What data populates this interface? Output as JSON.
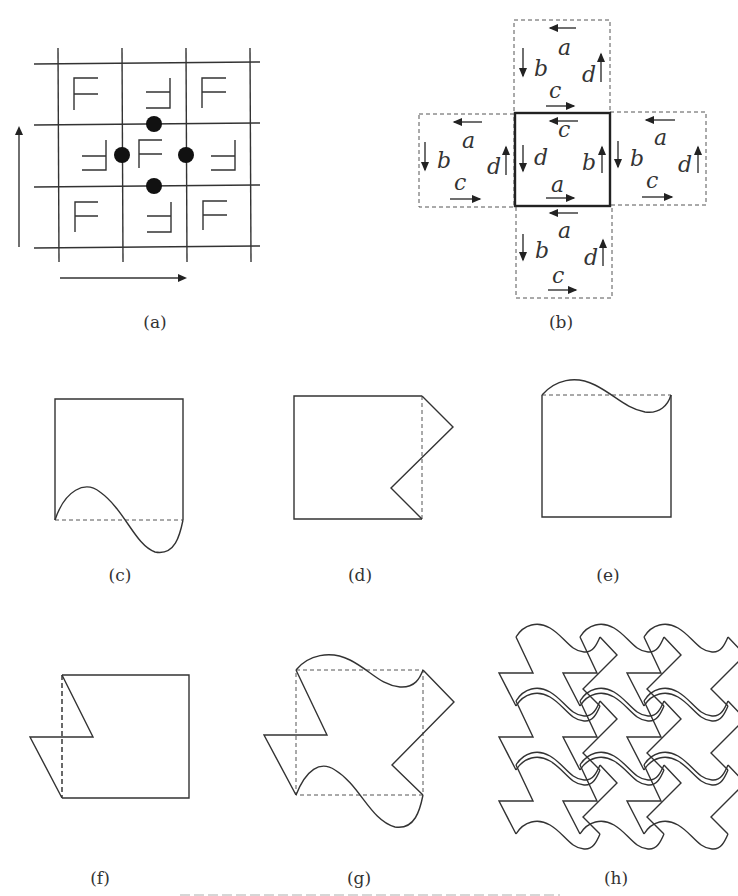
{
  "figure": {
    "panels": [
      {
        "id": "a",
        "label": "(a)",
        "description": "3x3 grid of F glyphs in alternating orientations with four glide/rotation centers (dots) and translation arrows"
      },
      {
        "id": "b",
        "label": "(b)",
        "description": "Central square with edge labels and four dashed neighbouring squares showing edge correspondences"
      },
      {
        "id": "c",
        "label": "(c)",
        "description": "Square with bottom edge replaced by S-curve"
      },
      {
        "id": "d",
        "label": "(d)",
        "description": "Square with right edge replaced by zig-zag"
      },
      {
        "id": "e",
        "label": "(e)",
        "description": "Square with top edge replaced by S-curve"
      },
      {
        "id": "f",
        "label": "(f)",
        "description": "Square with left edge replaced by zig-zag"
      },
      {
        "id": "g",
        "label": "(g)",
        "description": "Combined tile with all modified edges"
      },
      {
        "id": "h",
        "label": "(h)",
        "description": "Tiling of the plane by the combined tile"
      }
    ],
    "panel_a": {
      "glyph": "F",
      "dot_count": 4,
      "arrows": [
        "up-arrow",
        "right-arrow"
      ]
    },
    "panel_b": {
      "center": {
        "top": "c",
        "left": "d",
        "right": "b",
        "bottom": "a"
      },
      "neighbors": {
        "top": {
          "top": "a",
          "left": "b",
          "right": "d",
          "bottom": "c"
        },
        "left": {
          "top": "a",
          "left": "b",
          "right": "d",
          "bottom": "c"
        },
        "right": {
          "top": "a",
          "left": "b",
          "right": "d",
          "bottom": "c"
        },
        "bottom": {
          "top": "a",
          "left": "b",
          "right": "d",
          "bottom": "c"
        }
      }
    },
    "colors": {
      "line": "#333333",
      "background": "#ffffff"
    }
  }
}
